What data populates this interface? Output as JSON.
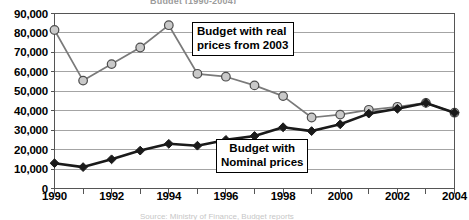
{
  "figure": {
    "title_partial": "Budget (1990-2004)",
    "caption_partial": "Source: Ministry of Finance, Budget reports"
  },
  "annotations": {
    "real": {
      "line1": "Budget with real",
      "line2": "prices from 2003"
    },
    "nominal": {
      "line1": "Budget with",
      "line2": "Nominal prices"
    }
  },
  "colors": {
    "axis": "#555555",
    "grid": "#9a9a9a",
    "real_line": "#7a7a7a",
    "real_marker_fill": "#c9c9c9",
    "real_marker_stroke": "#4d4d4d",
    "nominal_line": "#1a1a1a",
    "nominal_marker_fill": "#1a1a1a",
    "text": "#000000"
  },
  "chart_data": {
    "type": "line",
    "title": "Budget (1990-2004)",
    "xlabel": "",
    "ylabel": "",
    "xlim": [
      1990,
      2004
    ],
    "ylim": [
      0,
      90000
    ],
    "grid": true,
    "legend_position": "none (in-plot callout boxes)",
    "x": [
      1990,
      1991,
      1992,
      1993,
      1994,
      1995,
      1996,
      1997,
      1998,
      1999,
      2000,
      2001,
      2002,
      2003,
      2004
    ],
    "xticks": [
      "1990",
      "1991",
      "1992",
      "1993",
      "1994",
      "1995",
      "1996",
      "1997",
      "1998",
      "1999",
      "2000",
      "2001",
      "2002",
      "2003",
      "2004"
    ],
    "xtick_labels_shown": [
      "1990",
      "1992",
      "1994",
      "1996",
      "1998",
      "2000",
      "2002",
      "2004"
    ],
    "yticks": [
      0,
      10000,
      20000,
      30000,
      40000,
      50000,
      60000,
      70000,
      80000,
      90000
    ],
    "ytick_labels": [
      "0",
      "10,000",
      "20,000",
      "30,000",
      "40,000",
      "50,000",
      "60,000",
      "70,000",
      "80,000",
      "90,000"
    ],
    "series": [
      {
        "name": "Budget with real prices from 2003",
        "marker": "circle",
        "values": [
          81500,
          55500,
          64000,
          72500,
          84000,
          59000,
          57500,
          53000,
          47500,
          36500,
          38000,
          40500,
          42000,
          44000,
          39000
        ]
      },
      {
        "name": "Budget with Nominal prices",
        "marker": "diamond",
        "values": [
          13000,
          11000,
          15000,
          19500,
          23000,
          22000,
          25000,
          27000,
          31500,
          29500,
          33000,
          38500,
          41000,
          44000,
          39000
        ]
      }
    ]
  }
}
